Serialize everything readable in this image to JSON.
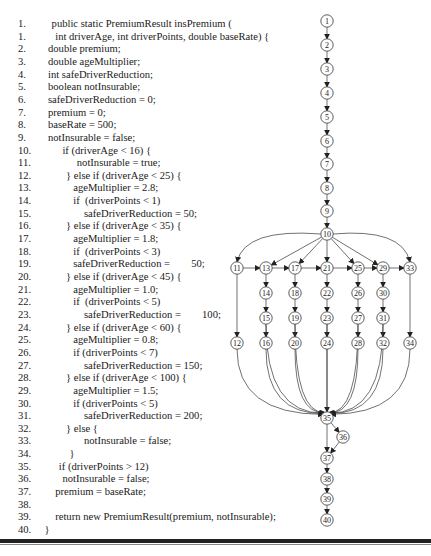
{
  "code": {
    "lines": [
      {
        "num": "1.",
        "indent": 1,
        "text": "public static PremiumResult insPremium ("
      },
      {
        "num": "1.",
        "indent": 2,
        "text": "int driverAge, int driverPoints, double baseRate) {"
      },
      {
        "num": "2.",
        "indent": 0,
        "text": "double premium;"
      },
      {
        "num": "3.",
        "indent": 0,
        "text": "double ageMultiplier;"
      },
      {
        "num": "4.",
        "indent": 0,
        "text": "int safeDriverReduction;"
      },
      {
        "num": "5.",
        "indent": 0,
        "text": "boolean notInsurable;"
      },
      {
        "num": "6.",
        "indent": 0,
        "text": "safeDriverReduction = 0;"
      },
      {
        "num": "7.",
        "indent": 0,
        "text": "premium = 0;"
      },
      {
        "num": "8.",
        "indent": 0,
        "text": "baseRate = 500;"
      },
      {
        "num": "9.",
        "indent": 0,
        "text": "notInsurable = false;"
      },
      {
        "num": "10.",
        "indent": 4,
        "text": "if (driverAge < 16) {"
      },
      {
        "num": "11.",
        "indent": 8,
        "text": "notInsurable = true;"
      },
      {
        "num": "12.",
        "indent": 5,
        "text": "} else if (driverAge < 25) {"
      },
      {
        "num": "13.",
        "indent": 7,
        "text": "ageMultiplier = 2.8;"
      },
      {
        "num": "14.",
        "indent": 7,
        "text": "if  (driverPoints < 1)"
      },
      {
        "num": "15.",
        "indent": 10,
        "text": "safeDriverReduction = 50;"
      },
      {
        "num": "16.",
        "indent": 5,
        "text": "} else if (driverAge < 35) {"
      },
      {
        "num": "17.",
        "indent": 7,
        "text": "ageMultiplier = 1.8;"
      },
      {
        "num": "18.",
        "indent": 7,
        "text": "if  (driverPoints < 3)"
      },
      {
        "num": "19.",
        "indent": 7,
        "text": "safeDriverReduction =        50;"
      },
      {
        "num": "20.",
        "indent": 5,
        "text": "} else if (driverAge < 45) {"
      },
      {
        "num": "21.",
        "indent": 7,
        "text": "ageMultiplier = 1.0;"
      },
      {
        "num": "22.",
        "indent": 7,
        "text": "if  (driverPoints < 5)"
      },
      {
        "num": "23.",
        "indent": 10,
        "text": "safeDriverReduction =        100;"
      },
      {
        "num": "24.",
        "indent": 5,
        "text": "} else if (driverAge < 60) {"
      },
      {
        "num": "25.",
        "indent": 7,
        "text": "ageMultiplier = 0.8;"
      },
      {
        "num": "26.",
        "indent": 7,
        "text": "if (driverPoints < 7)"
      },
      {
        "num": "27.",
        "indent": 10,
        "text": "safeDriverReduction = 150;"
      },
      {
        "num": "28.",
        "indent": 5,
        "text": "} else if (driverAge < 100) {"
      },
      {
        "num": "29.",
        "indent": 7,
        "text": "ageMultiplier = 1.5;"
      },
      {
        "num": "30.",
        "indent": 7,
        "text": "if (driverPoints < 5)"
      },
      {
        "num": "31.",
        "indent": 10,
        "text": "safeDriverReduction = 200;"
      },
      {
        "num": "32.",
        "indent": 5,
        "text": "} else {"
      },
      {
        "num": "33.",
        "indent": 10,
        "text": "notInsurable = false;"
      },
      {
        "num": "34.",
        "indent": 6,
        "text": "}"
      },
      {
        "num": "35.",
        "indent": 3,
        "text": "if (driverPoints > 12)"
      },
      {
        "num": "36.",
        "indent": 4,
        "text": "notInsurable = false;"
      },
      {
        "num": "37.",
        "indent": 2,
        "text": "premium = baseRate;"
      },
      {
        "num": "38.",
        "indent": 0,
        "text": ""
      },
      {
        "num": "39.",
        "indent": 2,
        "text": "return new PremiumResult(premium, notInsurable);"
      },
      {
        "num": "40.",
        "indent": -1,
        "text": "}"
      }
    ]
  },
  "graph": {
    "title": "control-flow-graph",
    "nodes": [
      {
        "id": "1",
        "x": 327,
        "y": 21
      },
      {
        "id": "2",
        "x": 327,
        "y": 45
      },
      {
        "id": "3",
        "x": 327,
        "y": 69
      },
      {
        "id": "4",
        "x": 327,
        "y": 93
      },
      {
        "id": "5",
        "x": 327,
        "y": 117
      },
      {
        "id": "6",
        "x": 327,
        "y": 141
      },
      {
        "id": "7",
        "x": 327,
        "y": 164
      },
      {
        "id": "8",
        "x": 327,
        "y": 188
      },
      {
        "id": "9",
        "x": 327,
        "y": 211
      },
      {
        "id": "10",
        "x": 327,
        "y": 234
      },
      {
        "id": "11",
        "x": 237,
        "y": 268
      },
      {
        "id": "13",
        "x": 266,
        "y": 268
      },
      {
        "id": "17",
        "x": 295,
        "y": 268
      },
      {
        "id": "21",
        "x": 327,
        "y": 268
      },
      {
        "id": "25",
        "x": 358,
        "y": 268
      },
      {
        "id": "29",
        "x": 383,
        "y": 268
      },
      {
        "id": "33",
        "x": 410,
        "y": 268
      },
      {
        "id": "14",
        "x": 266,
        "y": 293
      },
      {
        "id": "18",
        "x": 295,
        "y": 293
      },
      {
        "id": "22",
        "x": 327,
        "y": 293
      },
      {
        "id": "26",
        "x": 358,
        "y": 293
      },
      {
        "id": "30",
        "x": 383,
        "y": 293
      },
      {
        "id": "15",
        "x": 266,
        "y": 318
      },
      {
        "id": "19",
        "x": 295,
        "y": 318
      },
      {
        "id": "23",
        "x": 327,
        "y": 318
      },
      {
        "id": "27",
        "x": 358,
        "y": 318
      },
      {
        "id": "31",
        "x": 383,
        "y": 318
      },
      {
        "id": "12",
        "x": 237,
        "y": 343
      },
      {
        "id": "16",
        "x": 266,
        "y": 343
      },
      {
        "id": "20",
        "x": 295,
        "y": 343
      },
      {
        "id": "24",
        "x": 327,
        "y": 343
      },
      {
        "id": "28",
        "x": 358,
        "y": 343
      },
      {
        "id": "32",
        "x": 383,
        "y": 343
      },
      {
        "id": "34",
        "x": 410,
        "y": 343
      },
      {
        "id": "35",
        "x": 327,
        "y": 418
      },
      {
        "id": "36",
        "x": 343,
        "y": 437
      },
      {
        "id": "37",
        "x": 327,
        "y": 458
      },
      {
        "id": "38",
        "x": 327,
        "y": 479
      },
      {
        "id": "39",
        "x": 327,
        "y": 499
      },
      {
        "id": "40",
        "x": 327,
        "y": 520
      }
    ],
    "edges": [
      [
        "1",
        "2"
      ],
      [
        "2",
        "3"
      ],
      [
        "3",
        "4"
      ],
      [
        "4",
        "5"
      ],
      [
        "5",
        "6"
      ],
      [
        "6",
        "7"
      ],
      [
        "7",
        "8"
      ],
      [
        "8",
        "9"
      ],
      [
        "9",
        "10"
      ],
      [
        "10",
        "11"
      ],
      [
        "10",
        "13"
      ],
      [
        "10",
        "17"
      ],
      [
        "10",
        "21"
      ],
      [
        "10",
        "25"
      ],
      [
        "10",
        "29"
      ],
      [
        "10",
        "33"
      ],
      [
        "11",
        "13"
      ],
      [
        "13",
        "17"
      ],
      [
        "17",
        "21"
      ],
      [
        "21",
        "25"
      ],
      [
        "25",
        "29"
      ],
      [
        "29",
        "33"
      ],
      [
        "11",
        "12"
      ],
      [
        "13",
        "14"
      ],
      [
        "14",
        "15"
      ],
      [
        "15",
        "16"
      ],
      [
        "17",
        "18"
      ],
      [
        "18",
        "19"
      ],
      [
        "19",
        "20"
      ],
      [
        "21",
        "22"
      ],
      [
        "22",
        "23"
      ],
      [
        "23",
        "24"
      ],
      [
        "25",
        "26"
      ],
      [
        "26",
        "27"
      ],
      [
        "27",
        "28"
      ],
      [
        "29",
        "30"
      ],
      [
        "30",
        "31"
      ],
      [
        "31",
        "32"
      ],
      [
        "33",
        "34"
      ],
      [
        "12",
        "35"
      ],
      [
        "16",
        "35"
      ],
      [
        "20",
        "35"
      ],
      [
        "24",
        "35"
      ],
      [
        "28",
        "35"
      ],
      [
        "32",
        "35"
      ],
      [
        "34",
        "35"
      ],
      [
        "15",
        "35"
      ],
      [
        "19",
        "35"
      ],
      [
        "23",
        "35"
      ],
      [
        "27",
        "35"
      ],
      [
        "31",
        "35"
      ],
      [
        "35",
        "36"
      ],
      [
        "35",
        "37"
      ],
      [
        "36",
        "37"
      ],
      [
        "37",
        "38"
      ],
      [
        "38",
        "39"
      ],
      [
        "39",
        "40"
      ]
    ]
  }
}
